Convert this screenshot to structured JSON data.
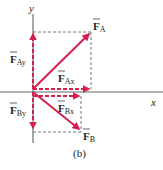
{
  "figure": {
    "caption": "(b)",
    "colors": {
      "vector": "#d3204f",
      "axis": "#555555",
      "guide": "#555555",
      "text": "#231f20"
    },
    "axes": {
      "x_label": "x",
      "y_label": "y"
    },
    "vectors": [
      {
        "id": "F_A",
        "symbol": "F",
        "subscript": "A",
        "kind": "resultant",
        "direction": "up-right"
      },
      {
        "id": "F_B",
        "symbol": "F",
        "subscript": "B",
        "kind": "resultant",
        "direction": "down-right"
      },
      {
        "id": "F_Ax",
        "symbol": "F",
        "subscript": "Ax",
        "kind": "component",
        "direction": "right"
      },
      {
        "id": "F_Ay",
        "symbol": "F",
        "subscript": "Ay",
        "kind": "component",
        "direction": "up"
      },
      {
        "id": "F_Bx",
        "symbol": "F",
        "subscript": "Bx",
        "kind": "component",
        "direction": "right"
      },
      {
        "id": "F_By",
        "symbol": "F",
        "subscript": "By",
        "kind": "component",
        "direction": "down"
      }
    ]
  }
}
